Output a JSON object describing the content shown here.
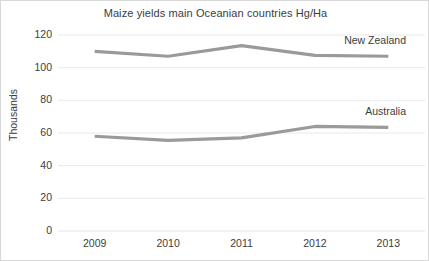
{
  "chart_data": {
    "type": "line",
    "title": "Maize yields main Oceanian countries Hg/Ha",
    "xlabel": "",
    "ylabel": "Thousands",
    "categories": [
      "2009",
      "2010",
      "2011",
      "2012",
      "2013"
    ],
    "x_tick_labels": [
      "2009",
      "2010",
      "2011",
      "2012",
      "2013"
    ],
    "y_tick_labels": [
      "0",
      "20",
      "40",
      "60",
      "80",
      "100",
      "120"
    ],
    "y_ticks": [
      0,
      20,
      40,
      60,
      80,
      100,
      120
    ],
    "ylim": [
      0,
      120
    ],
    "grid": "horizontal",
    "legend_position": "inline-right",
    "series": [
      {
        "name": "New Zealand",
        "values": [
          110,
          107,
          113.5,
          107.5,
          107
        ],
        "color": "#9a9a9a"
      },
      {
        "name": "Australia",
        "values": [
          58,
          55.5,
          57,
          64,
          63.5
        ],
        "color": "#9a9a9a"
      }
    ]
  },
  "labels": {
    "series_0_label": "New Zealand",
    "series_1_label": "Australia"
  }
}
